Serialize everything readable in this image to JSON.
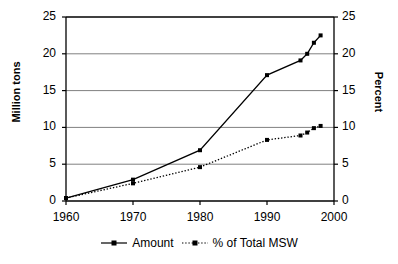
{
  "chart_data": {
    "type": "line",
    "title": "",
    "xlabel": "",
    "ylabel": "Million tons",
    "y2label": "Percent",
    "x": [
      1960,
      1970,
      1980,
      1990,
      1995,
      1996,
      1997,
      1998
    ],
    "xlim": [
      1960,
      2000
    ],
    "xticks": [
      1960,
      1970,
      1980,
      1990,
      2000
    ],
    "xtick_labels": [
      "1960",
      "1970",
      "1980",
      "1990",
      "2000"
    ],
    "ylim": [
      0,
      25
    ],
    "yticks": [
      0,
      5,
      10,
      15,
      20,
      25
    ],
    "ytick_labels": [
      "0",
      "5",
      "10",
      "15",
      "20",
      "25"
    ],
    "y2lim": [
      0,
      25
    ],
    "y2ticks": [
      0,
      5,
      10,
      15,
      20,
      25
    ],
    "y2tick_labels": [
      "0",
      "5",
      "10",
      "15",
      "20",
      "25"
    ],
    "grid": true,
    "grid_axis": "y",
    "legend_position": "bottom",
    "series": [
      {
        "name": "Amount",
        "axis": "left",
        "unit": "Million tons",
        "style": "solid",
        "color": "#000000",
        "marker": "square",
        "values": [
          0.4,
          2.9,
          6.9,
          17.1,
          19.1,
          20.0,
          21.5,
          22.5
        ]
      },
      {
        "name": "% of Total MSW",
        "axis": "right",
        "unit": "Percent",
        "style": "dotted",
        "color": "#000000",
        "marker": "square",
        "values": [
          0.4,
          2.4,
          4.6,
          8.3,
          8.9,
          9.3,
          9.9,
          10.2
        ]
      }
    ]
  },
  "axes": {
    "left_title": "Million tons",
    "right_title": "Percent"
  },
  "legend": {
    "items": [
      {
        "label": "Amount"
      },
      {
        "label": "% of Total MSW"
      }
    ]
  }
}
